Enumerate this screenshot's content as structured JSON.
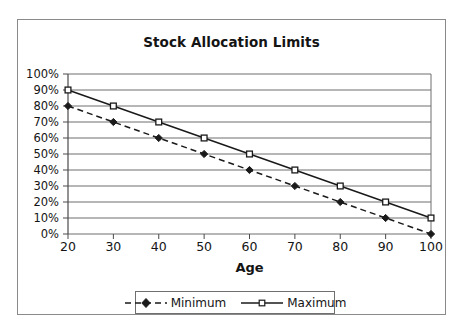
{
  "chart_data": {
    "type": "line",
    "title": "Stock Allocation Limits",
    "xlabel": "Age",
    "ylabel": "",
    "x": [
      20,
      30,
      40,
      50,
      60,
      70,
      80,
      90,
      100
    ],
    "xtick_labels": [
      "20",
      "30",
      "40",
      "50",
      "60",
      "70",
      "80",
      "90",
      "100"
    ],
    "ytick_labels": [
      "0%",
      "10%",
      "20%",
      "30%",
      "40%",
      "50%",
      "60%",
      "70%",
      "80%",
      "90%",
      "100%"
    ],
    "ytick_values": [
      0,
      10,
      20,
      30,
      40,
      50,
      60,
      70,
      80,
      90,
      100
    ],
    "xlim": [
      20,
      100
    ],
    "ylim": [
      0,
      100
    ],
    "grid": "horizontal",
    "legend_position": "bottom",
    "series": [
      {
        "name": "Minimum",
        "values": [
          80,
          70,
          60,
          50,
          40,
          30,
          20,
          10,
          0
        ],
        "line_style": "dashed",
        "marker": "filled-diamond",
        "color": "#1a1a1a"
      },
      {
        "name": "Maximum",
        "values": [
          90,
          80,
          70,
          60,
          50,
          40,
          30,
          20,
          10
        ],
        "line_style": "solid",
        "marker": "open-square",
        "color": "#1a1a1a"
      }
    ]
  },
  "legend": {
    "items": [
      {
        "label": "Minimum"
      },
      {
        "label": "Maximum"
      }
    ]
  },
  "colors": {
    "frame_border": "#8a8a8a",
    "gridline": "#6f6f6f",
    "axis": "#4a4a4a",
    "series": "#1a1a1a",
    "background": "#ffffff"
  }
}
